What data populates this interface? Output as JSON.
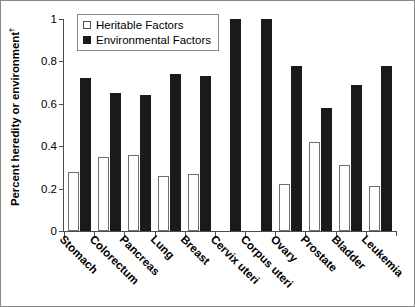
{
  "chart_data": {
    "type": "bar",
    "title": "",
    "xlabel": "",
    "ylabel": "Percent heredity or environment",
    "ylabel_superscript": "†",
    "ylim": [
      0,
      1
    ],
    "yticks": [
      "0",
      "0.2",
      "0.4",
      "0.6",
      "0.8",
      "1"
    ],
    "ytick_values": [
      0,
      0.2,
      0.4,
      0.6,
      0.8,
      1
    ],
    "grid": false,
    "legend_position": "top-left",
    "categories": [
      "Stomach",
      "Colorectum",
      "Pancreas",
      "Lung",
      "Breast",
      "Cervix uteri",
      "Corpus uteri",
      "Ovary",
      "Prostate",
      "Bladder",
      "Leukemia"
    ],
    "series": [
      {
        "name": "Heritable Factors",
        "color": "#ffffff",
        "edge_color": "#6e6e6e",
        "values": [
          0.28,
          0.35,
          0.36,
          0.26,
          0.27,
          0.0,
          0.0,
          0.22,
          0.42,
          0.31,
          0.21
        ]
      },
      {
        "name": "Environmental Factors",
        "color": "#1a1a1a",
        "edge_color": "#1a1a1a",
        "values": [
          0.72,
          0.65,
          0.64,
          0.74,
          0.73,
          1.0,
          1.0,
          0.78,
          0.58,
          0.69,
          0.78
        ]
      }
    ]
  },
  "legend": {
    "items": [
      {
        "label": "Heritable Factors",
        "marker": "open-square"
      },
      {
        "label": "Environmental Factors",
        "marker": "filled-square"
      }
    ]
  }
}
